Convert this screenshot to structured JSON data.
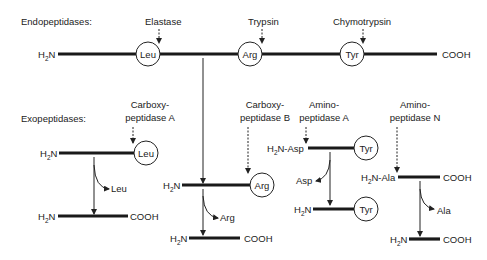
{
  "endo": {
    "heading": "Endopeptidases:",
    "n_term": "H",
    "n_sub": "2",
    "n_tail": "N",
    "c_term": "COOH",
    "residues": [
      "Leu",
      "Arg",
      "Tyr"
    ],
    "enzymes": [
      "Elastase",
      "Trypsin",
      "Chymotrypsin"
    ]
  },
  "exo": {
    "heading": "Exopeptidases:",
    "cpa": {
      "name1": "Carboxy-",
      "name2": "peptidase A",
      "residue": "Leu",
      "released": "Leu",
      "product_c": "COOH"
    },
    "cpb": {
      "name1": "Carboxy-",
      "name2": "peptidase B",
      "residue": "Arg",
      "released": "Arg",
      "product_c": "COOH"
    },
    "apa": {
      "name1": "Amino-",
      "name2": "peptidase A",
      "n_label": "N-Asp",
      "residue": "Tyr",
      "released": "Asp",
      "product_residue": "Tyr"
    },
    "apn": {
      "name1": "Amino-",
      "name2": "peptidase N",
      "n_label": "N-Ala",
      "c_term": "COOH",
      "released": "Ala",
      "product_c": "COOH"
    },
    "h": "H",
    "sub": "2",
    "n": "N"
  }
}
